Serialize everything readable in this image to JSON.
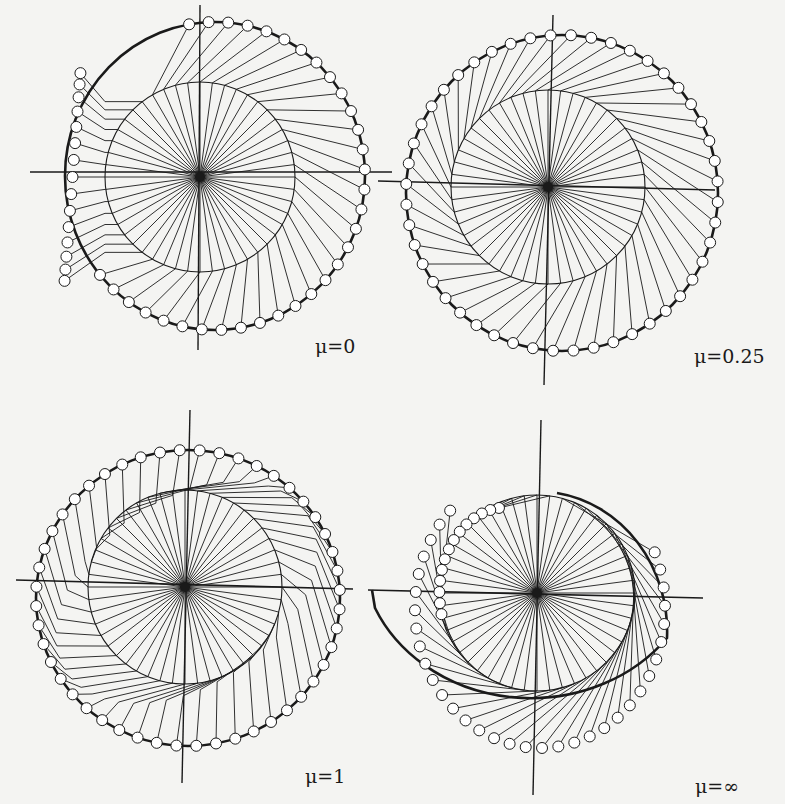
{
  "figure": {
    "panels": [
      {
        "id": "p1",
        "label": "μ=0",
        "cx": 200,
        "cy": 177,
        "inner_r": 95,
        "outer": {
          "cx": 215,
          "cy": 176,
          "rx": 150,
          "ry": 154
        },
        "axes": {
          "h": [
            30,
            172,
            392,
            172
          ],
          "v": [
            200,
            5,
            198,
            350
          ]
        },
        "label_pos": [
          315,
          345
        ],
        "rays": 48,
        "mode": "mu0"
      },
      {
        "id": "p2",
        "label": "μ=0.25",
        "cx": 548,
        "cy": 187,
        "inner_r": 97,
        "outer": {
          "cx": 562,
          "cy": 193,
          "rx": 156,
          "ry": 158
        },
        "axes": {
          "h": [
            378,
            181,
            715,
            190
          ],
          "v": [
            553,
            15,
            544,
            385
          ]
        },
        "label_pos": [
          694,
          355
        ],
        "rays": 48,
        "mode": "mu025"
      },
      {
        "id": "p3",
        "label": "μ=1",
        "cx": 185,
        "cy": 587,
        "inner_r": 97,
        "outer": {
          "cx": 188,
          "cy": 598,
          "rx": 152,
          "ry": 148
        },
        "axes": {
          "h": [
            16,
            580,
            353,
            589
          ],
          "v": [
            190,
            410,
            182,
            783
          ]
        },
        "label_pos": [
          305,
          760
        ],
        "rays": 48,
        "mode": "mu1"
      },
      {
        "id": "p4",
        "label": "μ=∞",
        "cx": 537,
        "cy": 593,
        "inner_r": 98,
        "outer": {
          "cx": 540,
          "cy": 608,
          "rx": 125,
          "ry": 140
        },
        "axes": {
          "h": [
            368,
            590,
            703,
            598
          ],
          "v": [
            541,
            420,
            533,
            795
          ]
        },
        "label_pos": [
          695,
          775
        ],
        "rays": 48,
        "mode": "muinf"
      }
    ]
  },
  "colors": {
    "ink": "#1a1a1a",
    "paper": "#f4f4f2",
    "marker_fill": "#ffffff"
  }
}
